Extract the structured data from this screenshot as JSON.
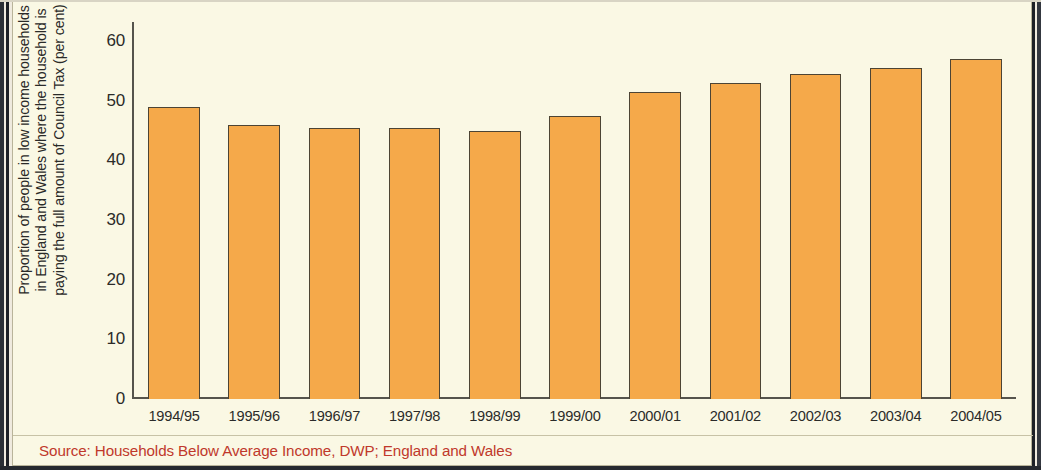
{
  "chart_data": {
    "type": "bar",
    "title": "",
    "subtitle": "",
    "xlabel": "",
    "ylabel": "Proportion of people in low income households\nin England and Wales where the household is\npaying the full amount of Council Tax (per cent)",
    "categories": [
      "1994/95",
      "1995/96",
      "1996/97",
      "1997/98",
      "1998/99",
      "1999/00",
      "2000/01",
      "2001/02",
      "2002/03",
      "2003/04",
      "2004/05"
    ],
    "values": [
      49.0,
      46.0,
      45.5,
      45.5,
      45.0,
      47.5,
      51.5,
      53.0,
      54.5,
      55.5,
      57.0
    ],
    "series": [
      {
        "name": "Proportion paying full Council Tax",
        "values": [
          49.0,
          46.0,
          45.5,
          45.5,
          45.0,
          47.5,
          51.5,
          53.0,
          54.5,
          55.5,
          57.0
        ]
      }
    ],
    "ylim": [
      0,
      60
    ],
    "y_ticks": [
      0,
      10,
      20,
      30,
      40,
      50,
      60
    ],
    "y_tick_labels": [
      "0",
      "10",
      "20",
      "30",
      "40",
      "50",
      "60"
    ],
    "grid": false,
    "legend": false,
    "legend_position": "none",
    "bar_color": "#F5A94A",
    "bar_edge_color": "#4C4434",
    "background_color": "#FAF8E4",
    "axis_color": "#55544C",
    "text_color": "#2B2B29"
  },
  "footer": {
    "source_note": "Source: Households Below Average Income, DWP; England and Wales",
    "source_color": "#C0392B"
  }
}
